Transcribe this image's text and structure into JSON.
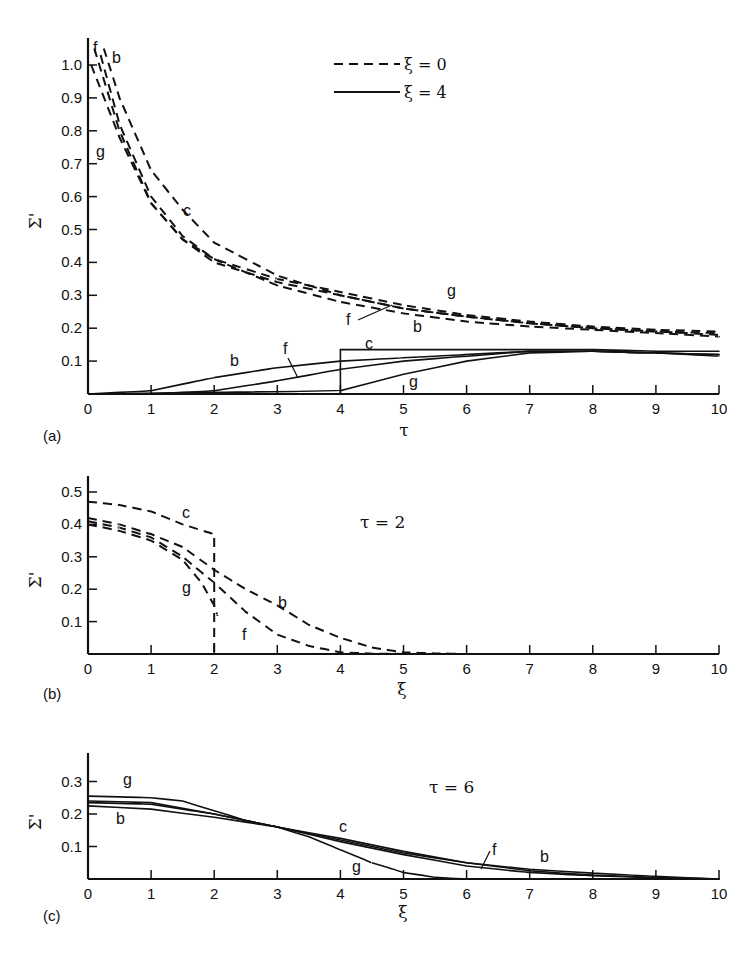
{
  "chart_data": [
    {
      "panel": "(a)",
      "type": "line",
      "title": "",
      "xlabel": "τ",
      "ylabel": "Σ'",
      "xlim": [
        0,
        10
      ],
      "ylim": [
        0,
        1.05
      ],
      "xticks": [
        "0",
        "1",
        "2",
        "3",
        "4",
        "5",
        "6",
        "7",
        "8",
        "9",
        "10"
      ],
      "yticks": [
        "0.1",
        "0.2",
        "0.3",
        "0.4",
        "0.5",
        "0.6",
        "0.7",
        "0.8",
        "0.9",
        "1.0"
      ],
      "legend": [
        {
          "label": "ξ = 0",
          "style": "dashed"
        },
        {
          "label": "ξ = 4",
          "style": "solid"
        }
      ],
      "legend_position": "upper center",
      "grid": false,
      "series": [
        {
          "name": "c (ξ=0)",
          "style": "dashed",
          "x": [
            0.25,
            0.5,
            1,
            1.5,
            2,
            3,
            4,
            5,
            6,
            7,
            8,
            9,
            10
          ],
          "y": [
            1.05,
            0.9,
            0.68,
            0.56,
            0.46,
            0.36,
            0.3,
            0.26,
            0.235,
            0.215,
            0.2,
            0.19,
            0.18
          ]
        },
        {
          "name": "b (ξ=0)",
          "style": "dashed",
          "x": [
            0.2,
            0.5,
            1,
            1.5,
            2,
            3,
            4,
            5,
            6,
            7,
            8,
            9,
            10
          ],
          "y": [
            1.03,
            0.82,
            0.6,
            0.48,
            0.41,
            0.33,
            0.28,
            0.245,
            0.22,
            0.205,
            0.195,
            0.185,
            0.175
          ]
        },
        {
          "name": "f (ξ=0)",
          "style": "dashed",
          "x": [
            0.1,
            0.5,
            1,
            1.5,
            2,
            3,
            4,
            5,
            6,
            7,
            8,
            9,
            10
          ],
          "y": [
            1.05,
            0.8,
            0.58,
            0.47,
            0.4,
            0.34,
            0.3,
            0.26,
            0.235,
            0.215,
            0.2,
            0.19,
            0.185
          ]
        },
        {
          "name": "g (ξ=0)",
          "style": "dashed",
          "x": [
            0.05,
            0.5,
            1,
            1.5,
            2,
            3,
            4,
            5,
            6,
            7,
            8,
            9,
            10
          ],
          "y": [
            1.0,
            0.78,
            0.58,
            0.47,
            0.41,
            0.35,
            0.31,
            0.27,
            0.24,
            0.22,
            0.205,
            0.195,
            0.19
          ]
        },
        {
          "name": "b (ξ=4)",
          "style": "solid",
          "x": [
            0,
            1,
            2,
            3,
            4,
            5,
            6,
            7,
            8,
            9,
            10
          ],
          "y": [
            0,
            0.01,
            0.05,
            0.08,
            0.1,
            0.11,
            0.12,
            0.13,
            0.13,
            0.125,
            0.12
          ]
        },
        {
          "name": "f (ξ=4)",
          "style": "solid",
          "x": [
            0,
            1,
            2,
            3,
            4,
            5,
            6,
            7,
            8,
            9,
            10
          ],
          "y": [
            0,
            0,
            0.01,
            0.04,
            0.075,
            0.1,
            0.115,
            0.13,
            0.13,
            0.125,
            0.12
          ]
        },
        {
          "name": "c (ξ=4)",
          "style": "solid",
          "x": [
            0,
            4,
            4,
            5,
            6,
            7,
            8,
            9,
            10
          ],
          "y": [
            0,
            0,
            0.135,
            0.135,
            0.135,
            0.135,
            0.135,
            0.13,
            0.13
          ]
        },
        {
          "name": "g (ξ=4)",
          "style": "solid",
          "x": [
            0,
            4,
            5,
            6,
            7,
            8,
            9,
            10
          ],
          "y": [
            0,
            0.01,
            0.06,
            0.1,
            0.125,
            0.13,
            0.125,
            0.115
          ]
        }
      ],
      "annotations": [
        "f",
        "b",
        "g",
        "c",
        "b",
        "f",
        "g",
        "f",
        "b",
        "c",
        "g"
      ]
    },
    {
      "panel": "(b)",
      "type": "line",
      "title": "τ = 2",
      "xlabel": "ξ",
      "ylabel": "Σ'",
      "xlim": [
        0,
        10
      ],
      "ylim": [
        0,
        0.55
      ],
      "xticks": [
        "0",
        "1",
        "2",
        "3",
        "4",
        "5",
        "6",
        "7",
        "8",
        "9",
        "10"
      ],
      "yticks": [
        "0.1",
        "0.2",
        "0.3",
        "0.4",
        "0.5"
      ],
      "grid": false,
      "series": [
        {
          "name": "c",
          "style": "dashed",
          "x": [
            0,
            0.5,
            1,
            1.5,
            2,
            2,
            2
          ],
          "y": [
            0.47,
            0.46,
            0.44,
            0.4,
            0.37,
            0.2,
            0
          ]
        },
        {
          "name": "b",
          "style": "dashed",
          "x": [
            0,
            0.5,
            1,
            1.5,
            2,
            2.5,
            3,
            3.5,
            4,
            4.5,
            5,
            5.5,
            6
          ],
          "y": [
            0.42,
            0.4,
            0.37,
            0.33,
            0.26,
            0.2,
            0.15,
            0.09,
            0.05,
            0.02,
            0.005,
            0.002,
            0
          ]
        },
        {
          "name": "f",
          "style": "dashed",
          "x": [
            0,
            0.5,
            1,
            1.5,
            2,
            2.5,
            3,
            3.5,
            4,
            4.5,
            5
          ],
          "y": [
            0.41,
            0.39,
            0.36,
            0.3,
            0.22,
            0.13,
            0.06,
            0.025,
            0.005,
            0.001,
            0
          ]
        },
        {
          "name": "g",
          "style": "dashed",
          "x": [
            0,
            0.5,
            1,
            1.5,
            1.8,
            2,
            2.05
          ],
          "y": [
            0.4,
            0.38,
            0.35,
            0.29,
            0.22,
            0.15,
            0.12
          ]
        }
      ],
      "annotations": [
        "c",
        "g",
        "b",
        "f"
      ]
    },
    {
      "panel": "(c)",
      "type": "line",
      "title": "τ = 6",
      "xlabel": "ξ",
      "ylabel": "Σ'",
      "xlim": [
        0,
        10
      ],
      "ylim": [
        0,
        0.35
      ],
      "xticks": [
        "0",
        "1",
        "2",
        "3",
        "4",
        "5",
        "6",
        "7",
        "8",
        "9",
        "10"
      ],
      "yticks": [
        "0.1",
        "0.2",
        "0.3"
      ],
      "grid": false,
      "series": [
        {
          "name": "g",
          "style": "solid",
          "x": [
            0,
            1,
            1.5,
            2,
            2.5,
            3,
            3.5,
            4,
            4.5,
            5,
            5.5,
            6,
            7
          ],
          "y": [
            0.255,
            0.25,
            0.24,
            0.21,
            0.18,
            0.16,
            0.13,
            0.09,
            0.05,
            0.02,
            0.005,
            0,
            0
          ]
        },
        {
          "name": "c",
          "style": "solid",
          "x": [
            0,
            1,
            2,
            3,
            4,
            5,
            6,
            7,
            8,
            9,
            10
          ],
          "y": [
            0.24,
            0.235,
            0.2,
            0.16,
            0.125,
            0.085,
            0.05,
            0.025,
            0.012,
            0.005,
            0
          ]
        },
        {
          "name": "f",
          "style": "solid",
          "x": [
            0,
            1,
            2,
            3,
            4,
            5,
            6,
            7,
            8,
            9,
            10
          ],
          "y": [
            0.235,
            0.23,
            0.2,
            0.16,
            0.115,
            0.075,
            0.04,
            0.02,
            0.01,
            0.004,
            0
          ]
        },
        {
          "name": "b",
          "style": "solid",
          "x": [
            0,
            1,
            2,
            3,
            4,
            5,
            6,
            7,
            8,
            9,
            10
          ],
          "y": [
            0.225,
            0.215,
            0.19,
            0.16,
            0.12,
            0.08,
            0.05,
            0.03,
            0.018,
            0.008,
            0
          ]
        }
      ],
      "annotations": [
        "g",
        "b",
        "c",
        "g",
        "f",
        "b"
      ]
    }
  ],
  "panels": {
    "a": {
      "label": "(a)",
      "xlabel": "τ",
      "ylabel": "Σ'",
      "legend_dashed": "ξ = 0",
      "legend_solid": "ξ = 4"
    },
    "b": {
      "label": "(b)",
      "xlabel": "ξ",
      "ylabel": "Σ'",
      "title": "τ = 2"
    },
    "c": {
      "label": "(c)",
      "xlabel": "ξ",
      "ylabel": "Σ'",
      "title": "τ = 6"
    }
  }
}
